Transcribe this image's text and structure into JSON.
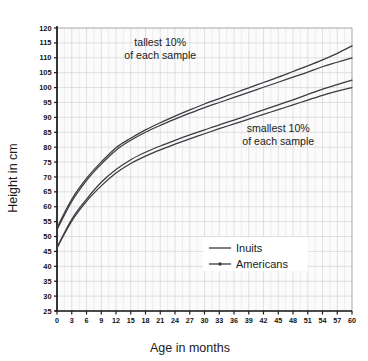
{
  "chart_data": {
    "type": "line",
    "title": "",
    "xlabel": "Age in months",
    "ylabel": "Height in cm",
    "xlim": [
      0,
      60
    ],
    "ylim": [
      25,
      120
    ],
    "xticks": [
      0,
      3,
      6,
      9,
      12,
      15,
      18,
      21,
      24,
      27,
      30,
      33,
      36,
      39,
      42,
      45,
      48,
      51,
      54,
      57,
      60
    ],
    "yticks": [
      25,
      30,
      35,
      40,
      45,
      50,
      55,
      60,
      65,
      70,
      75,
      80,
      85,
      90,
      95,
      100,
      105,
      110,
      115,
      120
    ],
    "grid": true,
    "legend_position": "inside-bottom-right",
    "annotations": [
      {
        "text_line1": "tallest 10%",
        "text_line2": "of each sample",
        "x": 21,
        "y": 114
      },
      {
        "text_line1": "smallest 10%",
        "text_line2": "of each sample",
        "x": 45,
        "y": 85
      }
    ],
    "x": [
      0,
      3,
      6,
      9,
      12,
      15,
      18,
      21,
      24,
      27,
      30,
      33,
      36,
      39,
      42,
      45,
      48,
      51,
      54,
      57,
      60
    ],
    "series": [
      {
        "name": "Inuits tallest 10%",
        "group": "tallest 10%",
        "population": "Inuits",
        "values": [
          53.0,
          62.5,
          69.5,
          75.0,
          79.8,
          83.0,
          85.8,
          88.2,
          90.4,
          92.5,
          94.5,
          96.3,
          98.1,
          99.9,
          101.7,
          103.5,
          105.4,
          107.3,
          109.3,
          111.5,
          114.0
        ]
      },
      {
        "name": "Americans tallest 10%",
        "group": "tallest 10%",
        "population": "Americans",
        "values": [
          52.3,
          61.8,
          68.8,
          74.3,
          79.0,
          82.3,
          85.0,
          87.3,
          89.4,
          91.4,
          93.3,
          95.0,
          96.7,
          98.4,
          100.1,
          101.8,
          103.5,
          105.2,
          107.0,
          108.5,
          110.0
        ]
      },
      {
        "name": "Inuits smallest 10%",
        "group": "smallest 10%",
        "population": "Inuits",
        "values": [
          46.3,
          55.8,
          62.5,
          68.2,
          72.5,
          75.8,
          78.3,
          80.4,
          82.3,
          84.1,
          85.8,
          87.5,
          89.1,
          90.8,
          92.5,
          94.2,
          95.9,
          97.7,
          99.5,
          101.0,
          102.5
        ]
      },
      {
        "name": "Americans smallest 10%",
        "group": "smallest 10%",
        "population": "Americans",
        "values": [
          46.2,
          55.2,
          61.8,
          67.0,
          71.3,
          74.5,
          77.0,
          79.1,
          81.0,
          82.8,
          84.5,
          86.2,
          87.8,
          89.4,
          91.0,
          92.6,
          94.2,
          95.8,
          97.4,
          98.8,
          100.0
        ]
      }
    ],
    "legend": [
      {
        "label": "Inuits",
        "marker": "line"
      },
      {
        "label": "Americans",
        "marker": "line-with-dot"
      }
    ],
    "colors": {
      "curve": "#3b3b42",
      "grid": "#c9c9cc",
      "axis": "#1c1c1c",
      "text": "#1a1a1a",
      "background": "#ffffff",
      "plot_background": "#fbfbfb"
    }
  }
}
